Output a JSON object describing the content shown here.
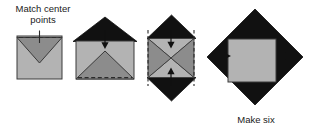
{
  "figure": {
    "type": "sewing-instruction-diagram",
    "step_count": 4,
    "captions": {
      "match_center": "Match center\npoints",
      "make_six": "Make six"
    },
    "colors": {
      "background": "#ffffff",
      "light_gray": "#b3b3b3",
      "medium_gray": "#8c8c8c",
      "black": "#111111",
      "outline": "#3a3a3a",
      "dashed_line": "#2b2b2b",
      "arrow": "#111111",
      "text": "#1a1a1a"
    },
    "steps": [
      {
        "index": 1,
        "name": "step-1-square-with-folded-triangle",
        "shapes": [
          {
            "kind": "square",
            "fill": "light_gray",
            "x": 17,
            "y": 36,
            "w": 45,
            "h": 43
          },
          {
            "kind": "triangle-down",
            "fill": "medium_gray",
            "points": "17,38 62,38 39.5,63"
          }
        ],
        "dashed_lines": [
          {
            "x1": 19,
            "y1": 38,
            "x2": 60,
            "y2": 38
          }
        ],
        "tick_marks": [
          {
            "x": 39.5,
            "y1": 31,
            "y2": 43
          }
        ],
        "arrows": []
      },
      {
        "index": 2,
        "name": "step-2-black-triangle-over-square",
        "shapes": [
          {
            "kind": "triangle-up",
            "fill": "black",
            "points": "73,41 137,41 105,17"
          },
          {
            "kind": "square",
            "fill": "light_gray",
            "x": 76,
            "y": 41,
            "w": 58,
            "h": 38
          },
          {
            "kind": "triangle-up",
            "fill": "medium_gray",
            "points": "76,79 134,79 105,51"
          }
        ],
        "dashed_lines": [
          {
            "x1": 78,
            "y1": 78,
            "x2": 132,
            "y2": 78
          }
        ],
        "tick_marks": [],
        "arrows": [
          {
            "dir": "down",
            "x": 105,
            "y": 38,
            "len": 9
          }
        ]
      },
      {
        "index": 3,
        "name": "step-3-hourglass-with-black-points",
        "shapes": [
          {
            "kind": "triangle-up",
            "fill": "black",
            "points": "147,38 196,38 171,15"
          },
          {
            "kind": "triangle-down",
            "fill": "black",
            "points": "147,78 196,78 171,101"
          },
          {
            "kind": "triangle-right",
            "fill": "medium_gray",
            "points": "148,38 148,78 171,58"
          },
          {
            "kind": "triangle-left",
            "fill": "medium_gray",
            "points": "194,38 194,78 171,58"
          },
          {
            "kind": "triangle-down",
            "fill": "light_gray",
            "points": "148,38 194,38 171,58"
          },
          {
            "kind": "triangle-up",
            "fill": "light_gray",
            "points": "148,78 194,78 171,58"
          }
        ],
        "dashed_lines": [
          {
            "x1": 148,
            "y1": 31,
            "x2": 148,
            "y2": 85
          },
          {
            "x1": 194,
            "y1": 31,
            "x2": 194,
            "y2": 85
          }
        ],
        "tick_marks": [],
        "arrows": [
          {
            "dir": "down",
            "x": 171,
            "y": 38,
            "len": 10
          },
          {
            "dir": "up",
            "x": 171,
            "y": 78,
            "len": 10
          }
        ]
      },
      {
        "index": 4,
        "name": "step-4-black-diamond-with-center-square",
        "shapes": [
          {
            "kind": "diamond",
            "fill": "black",
            "cx": 255,
            "cy": 57,
            "rx": 48,
            "ry": 48
          },
          {
            "kind": "square",
            "fill": "light_gray",
            "x": 228,
            "y": 39,
            "w": 48,
            "h": 43
          }
        ],
        "dashed_lines": [],
        "tick_marks": [],
        "arrows": [
          {
            "dir": "right",
            "x": 220,
            "y": 56,
            "len": 15
          },
          {
            "dir": "left",
            "x": 290,
            "y": 56,
            "len": 15
          }
        ]
      }
    ]
  }
}
